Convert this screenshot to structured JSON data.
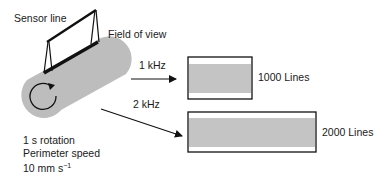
{
  "labels": {
    "sensor_line": "Sensor line",
    "field_of_view": "Field of view",
    "freq_1": "1 kHz",
    "freq_2": "2 kHz",
    "lines_1": "1000 Lines",
    "lines_2": "2000 Lines",
    "rotation": "1 s rotation",
    "perimeter_speed": "Perimeter speed",
    "speed_value": "10 mm  s",
    "speed_exponent": "−1"
  },
  "colors": {
    "cylinder": "#bdbdbd",
    "band": "#c4c4c4",
    "line": "#111111",
    "background": "#ffffff"
  },
  "images": [
    {
      "name": "image-1000-lines",
      "frequency": "1 kHz",
      "lines": 1000
    },
    {
      "name": "image-2000-lines",
      "frequency": "2 kHz",
      "lines": 2000
    }
  ]
}
